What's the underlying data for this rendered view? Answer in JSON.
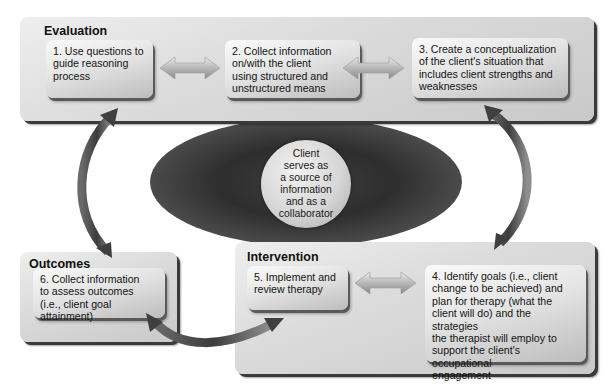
{
  "diagram": {
    "type": "process-cycle",
    "colors": {
      "panel": "#d6d6d6",
      "box": "#e6e6e6",
      "shadow": "#3a3a3a",
      "hub_dark": "#333333",
      "hub_circle": "#d6d6d6",
      "arrow": "#555555"
    },
    "panels": {
      "evaluation": {
        "title": "Evaluation",
        "steps": [
          {
            "number": "1.",
            "lines": [
              "1.  Use questions to",
              "guide reasoning",
              "process"
            ]
          },
          {
            "number": "2.",
            "lines": [
              "2.  Collect information",
              "on/with the client",
              "using structured and",
              "unstructured means"
            ]
          },
          {
            "number": "3.",
            "lines": [
              "3.  Create a conceptualization",
              "of the client's situation that",
              "includes client strengths and",
              "weaknesses"
            ]
          }
        ]
      },
      "outcomes": {
        "title": "Outcomes",
        "steps": [
          {
            "number": "6.",
            "lines": [
              "6.  Collect information",
              "to assess outcomes",
              "(i.e., client goal attainment)"
            ]
          }
        ]
      },
      "intervention": {
        "title": "Intervention",
        "steps": [
          {
            "number": "5.",
            "lines": [
              "5.  Implement and",
              "review therapy"
            ]
          },
          {
            "number": "4.",
            "lines": [
              "4.  Identify goals (i.e., client",
              "change to be achieved) and",
              "plan for therapy (what the",
              "client will do) and the strategies",
              "the therapist will employ to",
              "support the client's occupational",
              "engagement"
            ]
          }
        ]
      }
    },
    "hub": {
      "lines": [
        "Client",
        "serves as",
        "a source of",
        "information",
        "and as a",
        "collaborator"
      ]
    },
    "connectors": [
      {
        "from": "1",
        "to": "2",
        "style": "double-arrow"
      },
      {
        "from": "2",
        "to": "3",
        "style": "double-arrow"
      },
      {
        "from": "3",
        "to": "4",
        "style": "curved-double-arrow"
      },
      {
        "from": "4",
        "to": "5",
        "style": "double-arrow"
      },
      {
        "from": "5",
        "to": "6",
        "style": "curved-double-arrow"
      },
      {
        "from": "6",
        "to": "1",
        "style": "curved-double-arrow"
      }
    ]
  }
}
